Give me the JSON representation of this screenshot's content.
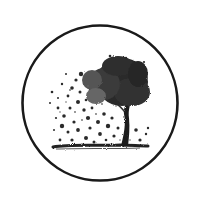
{
  "image": {
    "description": "Circular emblem with a windswept tree whose leaves scatter to the left above a ground line",
    "colors": {
      "background": "#ffffff",
      "ink": "#1a1a1a",
      "ink_mid": "#3a3a3a",
      "ink_light": "#6a6a6a"
    }
  }
}
